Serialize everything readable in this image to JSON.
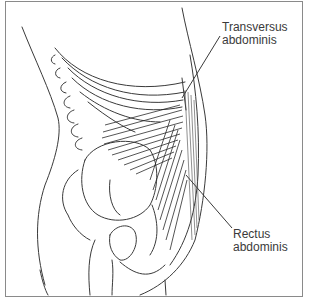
{
  "diagram": {
    "type": "anatomical-illustration",
    "labels": [
      {
        "id": "transversus",
        "line1": "Transversus",
        "line2": "abdominis"
      },
      {
        "id": "rectus",
        "line1": "Rectus",
        "line2": "abdominis"
      }
    ],
    "colors": {
      "line": "#3a3a3a",
      "frame": "#8a8a8a",
      "background": "#ffffff"
    }
  }
}
